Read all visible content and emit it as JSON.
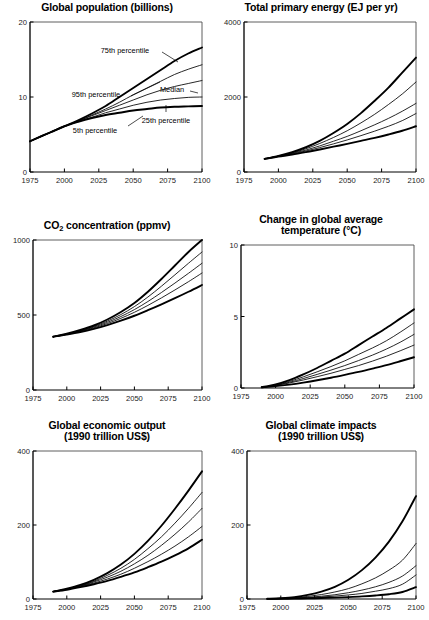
{
  "figure": {
    "background": "#ffffff",
    "ink": "#000000",
    "panel_count": 6
  },
  "panels": [
    {
      "id": "global-population",
      "title": "Global population (billions)",
      "title_lines": [
        "Global population (billions)"
      ]
    },
    {
      "id": "total-primary-energy",
      "title": "Total primary energy (EJ per yr)",
      "title_lines": [
        "Total primary energy (EJ per yr)"
      ]
    },
    {
      "id": "co2-concentration",
      "title": "CO2 concentration (ppmv)",
      "title_lines": [
        "CO2 concentration (ppmv)"
      ]
    },
    {
      "id": "temperature-change",
      "title": "Change in global average temperature (°C)",
      "title_lines": [
        "Change in global average",
        "temperature (°C)"
      ]
    },
    {
      "id": "global-economic-output",
      "title": "Global economic output (1990 trillion US$)",
      "title_lines": [
        "Global economic output",
        "(1990 trillion US$)"
      ]
    },
    {
      "id": "global-climate-impacts",
      "title": "Global climate impacts (1990 trillion US$)",
      "title_lines": [
        "Global climate impacts",
        "(1990 trillion US$)"
      ]
    }
  ],
  "chart_data": [
    {
      "type": "line",
      "id": "global-population",
      "title": "Global population (billions)",
      "xlabel": "",
      "ylabel": "",
      "xlim": [
        1975,
        2100
      ],
      "ylim": [
        0,
        20
      ],
      "xticks": [
        1975,
        2000,
        2025,
        2050,
        2075,
        2100
      ],
      "xticklabels": [
        "1975",
        "2000",
        "2025",
        "2050",
        "2075",
        "2100"
      ],
      "yticks": [
        0,
        10,
        20
      ],
      "yticklabels": [
        "0",
        "10",
        "20"
      ],
      "grid": false,
      "legend_position": "inline-annotations",
      "x": [
        1975,
        1990,
        2000,
        2010,
        2020,
        2030,
        2040,
        2050,
        2060,
        2070,
        2080,
        2090,
        2100
      ],
      "series": [
        {
          "name": "95th percentile",
          "width": "thick",
          "values": [
            4.1,
            5.3,
            6.1,
            6.9,
            7.8,
            8.8,
            10.0,
            11.2,
            12.4,
            13.6,
            14.8,
            15.8,
            16.6
          ]
        },
        {
          "name": "75th percentile",
          "width": "thin",
          "values": [
            4.1,
            5.3,
            6.1,
            6.8,
            7.6,
            8.4,
            9.3,
            10.3,
            11.2,
            12.1,
            13.0,
            13.7,
            14.3
          ]
        },
        {
          "name": "Median",
          "width": "thin",
          "values": [
            4.1,
            5.3,
            6.1,
            6.8,
            7.5,
            8.2,
            8.9,
            9.6,
            10.3,
            10.9,
            11.4,
            11.8,
            12.2
          ]
        },
        {
          "name": "25th percentile",
          "width": "thin",
          "values": [
            4.1,
            5.3,
            6.1,
            6.7,
            7.3,
            7.9,
            8.4,
            8.9,
            9.3,
            9.6,
            9.8,
            9.95,
            10.0
          ]
        },
        {
          "name": "5th percentile",
          "width": "thick",
          "values": [
            4.1,
            5.3,
            6.1,
            6.7,
            7.2,
            7.6,
            7.9,
            8.2,
            8.4,
            8.6,
            8.7,
            8.75,
            8.8
          ]
        }
      ],
      "annotations": [
        {
          "text": "75th percentile",
          "x_px": 125,
          "y_px": 58,
          "anchor": "middle",
          "leader": [
            [
              162,
              60
            ],
            [
              178,
              70
            ]
          ]
        },
        {
          "text": "Median",
          "x_px": 172,
          "y_px": 97,
          "anchor": "middle",
          "leader": [
            [
              190,
              99
            ],
            [
              198,
              101
            ]
          ]
        },
        {
          "text": "95th percentile",
          "x_px": 96,
          "y_px": 102,
          "anchor": "middle",
          "leader": [
            [
              131,
              104
            ],
            [
              160,
              90
            ]
          ]
        },
        {
          "text": "25th percentile",
          "x_px": 166,
          "y_px": 128,
          "anchor": "middle",
          "leader": [
            [
              166,
              120
            ],
            [
              166,
              113
            ]
          ]
        },
        {
          "text": "5th percentile",
          "x_px": 95,
          "y_px": 138,
          "anchor": "middle",
          "leader": [
            [
              128,
              134
            ],
            [
              143,
              124
            ]
          ]
        }
      ]
    },
    {
      "type": "line",
      "id": "total-primary-energy",
      "title": "Total primary energy (EJ per yr)",
      "xlabel": "",
      "ylabel": "",
      "xlim": [
        1975,
        2100
      ],
      "ylim": [
        0,
        4000
      ],
      "xticks": [
        1975,
        2000,
        2025,
        2050,
        2075,
        2100
      ],
      "xticklabels": [
        "1975",
        "2000",
        "2025",
        "2050",
        "2075",
        "2100"
      ],
      "yticks": [
        0,
        2000,
        4000
      ],
      "yticklabels": [
        "0",
        "2000",
        "4000"
      ],
      "grid": false,
      "legend_position": "none",
      "x": [
        1990,
        2000,
        2010,
        2020,
        2030,
        2040,
        2050,
        2060,
        2070,
        2080,
        2090,
        2100
      ],
      "series": [
        {
          "name": "95th percentile",
          "width": "thick",
          "values": [
            350,
            430,
            530,
            660,
            830,
            1040,
            1280,
            1570,
            1900,
            2250,
            2650,
            3050
          ]
        },
        {
          "name": "75th percentile",
          "width": "thin",
          "values": [
            350,
            425,
            510,
            620,
            760,
            920,
            1100,
            1310,
            1540,
            1800,
            2080,
            2400
          ]
        },
        {
          "name": "Median",
          "width": "thin",
          "values": [
            350,
            420,
            495,
            585,
            695,
            820,
            950,
            1100,
            1260,
            1430,
            1620,
            1830
          ]
        },
        {
          "name": "25th percentile",
          "width": "thin",
          "values": [
            350,
            415,
            480,
            560,
            650,
            750,
            855,
            970,
            1090,
            1220,
            1370,
            1560
          ]
        },
        {
          "name": "5th percentile",
          "width": "thick",
          "values": [
            350,
            410,
            465,
            530,
            600,
            675,
            750,
            830,
            910,
            1000,
            1100,
            1220
          ]
        }
      ],
      "annotations": []
    },
    {
      "type": "line",
      "id": "co2-concentration",
      "title": "CO2 concentration (ppmv)",
      "xlabel": "",
      "ylabel": "",
      "xlim": [
        1975,
        2100
      ],
      "ylim": [
        0,
        1000
      ],
      "xticks": [
        1975,
        2000,
        2025,
        2050,
        2075,
        2100
      ],
      "xticklabels": [
        "1975",
        "2000",
        "2025",
        "2050",
        "2075",
        "2100"
      ],
      "yticks": [
        0,
        500,
        1000
      ],
      "yticklabels": [
        "0",
        "500",
        "1000"
      ],
      "grid": false,
      "legend_position": "none",
      "x": [
        1990,
        2000,
        2010,
        2020,
        2030,
        2040,
        2050,
        2060,
        2070,
        2080,
        2090,
        2100
      ],
      "series": [
        {
          "name": "95th percentile",
          "width": "thick",
          "values": [
            355,
            375,
            400,
            430,
            470,
            520,
            580,
            655,
            740,
            830,
            920,
            1000
          ]
        },
        {
          "name": "75th percentile",
          "width": "thin",
          "values": [
            355,
            373,
            396,
            424,
            459,
            503,
            556,
            620,
            692,
            768,
            845,
            920
          ]
        },
        {
          "name": "Median",
          "width": "thin",
          "values": [
            355,
            372,
            393,
            419,
            451,
            490,
            536,
            590,
            650,
            713,
            778,
            845
          ]
        },
        {
          "name": "25th percentile",
          "width": "thin",
          "values": [
            355,
            371,
            390,
            414,
            443,
            478,
            518,
            564,
            614,
            667,
            722,
            780
          ]
        },
        {
          "name": "5th percentile",
          "width": "thick",
          "values": [
            355,
            370,
            387,
            408,
            433,
            462,
            495,
            532,
            571,
            612,
            655,
            700
          ]
        }
      ],
      "annotations": []
    },
    {
      "type": "line",
      "id": "temperature-change",
      "title": "Change in global average temperature (°C)",
      "xlabel": "",
      "ylabel": "",
      "xlim": [
        1975,
        2100
      ],
      "ylim": [
        0,
        10
      ],
      "xticks": [
        1975,
        2000,
        2025,
        2050,
        2075,
        2100
      ],
      "xticklabels": [
        "1975",
        "2000",
        "2025",
        "2050",
        "2075",
        "2100"
      ],
      "yticks": [
        0,
        5,
        10
      ],
      "yticklabels": [
        "0",
        "5",
        "10"
      ],
      "grid": false,
      "legend_position": "none",
      "x": [
        1990,
        2000,
        2010,
        2020,
        2030,
        2040,
        2050,
        2060,
        2070,
        2080,
        2090,
        2100
      ],
      "series": [
        {
          "name": "95th percentile",
          "width": "thick",
          "values": [
            0.05,
            0.25,
            0.55,
            0.95,
            1.4,
            1.9,
            2.4,
            3.0,
            3.6,
            4.2,
            4.85,
            5.5
          ]
        },
        {
          "name": "75th percentile",
          "width": "thin",
          "values": [
            0.05,
            0.22,
            0.46,
            0.78,
            1.13,
            1.5,
            1.9,
            2.35,
            2.8,
            3.3,
            3.9,
            4.55
          ]
        },
        {
          "name": "Median",
          "width": "thin",
          "values": [
            0.05,
            0.2,
            0.4,
            0.66,
            0.95,
            1.25,
            1.57,
            1.92,
            2.3,
            2.72,
            3.2,
            3.75
          ]
        },
        {
          "name": "25th percentile",
          "width": "thin",
          "values": [
            0.05,
            0.18,
            0.35,
            0.56,
            0.79,
            1.03,
            1.3,
            1.57,
            1.88,
            2.22,
            2.6,
            3.0
          ]
        },
        {
          "name": "5th percentile",
          "width": "thick",
          "values": [
            0.05,
            0.13,
            0.24,
            0.38,
            0.54,
            0.72,
            0.92,
            1.13,
            1.36,
            1.6,
            1.87,
            2.15
          ]
        }
      ],
      "annotations": []
    },
    {
      "type": "line",
      "id": "global-economic-output",
      "title": "Global economic output (1990 trillion US$)",
      "xlabel": "",
      "ylabel": "",
      "xlim": [
        1975,
        2100
      ],
      "ylim": [
        0,
        400
      ],
      "xticks": [
        1975,
        2000,
        2025,
        2050,
        2075,
        2100
      ],
      "xticklabels": [
        "1975",
        "2000",
        "2025",
        "2050",
        "2075",
        "2100"
      ],
      "yticks": [
        0,
        200,
        400
      ],
      "yticklabels": [
        "0",
        "200",
        "400"
      ],
      "grid": false,
      "legend_position": "none",
      "x": [
        1990,
        2000,
        2010,
        2020,
        2030,
        2040,
        2050,
        2060,
        2070,
        2080,
        2090,
        2100
      ],
      "series": [
        {
          "name": "95th percentile",
          "width": "thick",
          "values": [
            20,
            28,
            38,
            52,
            70,
            93,
            122,
            157,
            198,
            244,
            293,
            345
          ]
        },
        {
          "name": "75th percentile",
          "width": "thin",
          "values": [
            20,
            27,
            36,
            48,
            64,
            83,
            107,
            136,
            168,
            205,
            245,
            288
          ]
        },
        {
          "name": "Median",
          "width": "thin",
          "values": [
            20,
            27,
            35,
            46,
            59,
            75,
            95,
            118,
            145,
            175,
            208,
            245
          ]
        },
        {
          "name": "25th percentile",
          "width": "thin",
          "values": [
            20,
            26,
            34,
            43,
            54,
            67,
            83,
            101,
            121,
            143,
            168,
            196
          ]
        },
        {
          "name": "5th percentile",
          "width": "thick",
          "values": [
            20,
            25,
            32,
            40,
            49,
            60,
            72,
            86,
            101,
            118,
            137,
            160
          ]
        }
      ],
      "annotations": []
    },
    {
      "type": "line",
      "id": "global-climate-impacts",
      "title": "Global climate impacts (1990 trillion US$)",
      "xlabel": "",
      "ylabel": "",
      "xlim": [
        1975,
        2100
      ],
      "ylim": [
        0,
        400
      ],
      "xticks": [
        1975,
        2000,
        2025,
        2050,
        2075,
        2100
      ],
      "xticklabels": [
        "1975",
        "2000",
        "2025",
        "2050",
        "2075",
        "2100"
      ],
      "yticks": [
        0,
        200,
        400
      ],
      "yticklabels": [
        "0",
        "200",
        "400"
      ],
      "grid": false,
      "legend_position": "none",
      "x": [
        1990,
        2000,
        2010,
        2020,
        2030,
        2040,
        2050,
        2060,
        2070,
        2080,
        2090,
        2100
      ],
      "series": [
        {
          "name": "95th percentile",
          "width": "thick",
          "values": [
            0.5,
            2,
            5,
            11,
            20,
            33,
            52,
            78,
            112,
            155,
            210,
            278
          ]
        },
        {
          "name": "75th percentile",
          "width": "thin",
          "values": [
            0.5,
            1.5,
            3.5,
            7,
            12,
            19,
            28,
            41,
            57,
            78,
            105,
            150
          ]
        },
        {
          "name": "Median",
          "width": "thin",
          "values": [
            0.5,
            1.2,
            2.5,
            4.5,
            7.5,
            11.5,
            17,
            24,
            33,
            45,
            62,
            90
          ]
        },
        {
          "name": "25th percentile",
          "width": "thin",
          "values": [
            0.5,
            1.0,
            2.0,
            3.4,
            5.3,
            7.8,
            11,
            15,
            21,
            28,
            40,
            65
          ]
        },
        {
          "name": "5th percentile",
          "width": "thick",
          "values": [
            0.3,
            0.6,
            1.1,
            1.8,
            2.7,
            3.8,
            5.2,
            7,
            9.5,
            13,
            19,
            32
          ]
        }
      ],
      "annotations": []
    }
  ]
}
